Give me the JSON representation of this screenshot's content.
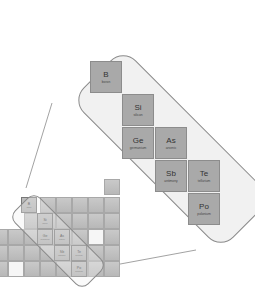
{
  "diagram": {
    "elements": [
      {
        "symbol": "B",
        "name": "boron"
      },
      {
        "symbol": "Si",
        "name": "silicon"
      },
      {
        "symbol": "Ge",
        "name": "germanium"
      },
      {
        "symbol": "As",
        "name": "arsenic"
      },
      {
        "symbol": "Sb",
        "name": "antimony"
      },
      {
        "symbol": "Te",
        "name": "tellurium"
      },
      {
        "symbol": "Po",
        "name": "polonium"
      }
    ],
    "colors": {
      "cell": "#a9a9a9",
      "lozenge": "#f1f1f1",
      "outline": "#8a8a8a"
    }
  }
}
